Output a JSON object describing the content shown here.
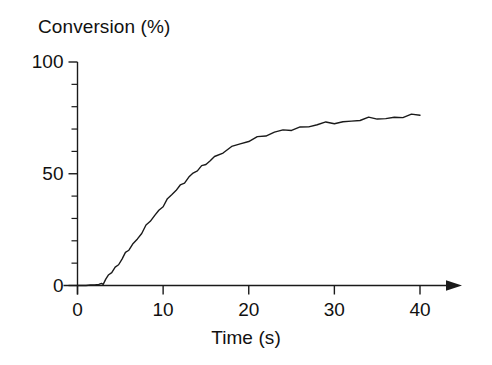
{
  "chart_data": {
    "type": "line",
    "title": "",
    "ylabel": "Conversion (%)",
    "xlabel": "Time (s)",
    "xlim": [
      0,
      45
    ],
    "ylim": [
      0,
      100
    ],
    "grid": false,
    "legend": "none",
    "x_ticks": [
      0,
      10,
      20,
      30,
      40
    ],
    "x_tick_labels": [
      "0",
      "10",
      "20",
      "30",
      "40"
    ],
    "x_minor_ticks": [],
    "y_ticks": [
      0,
      50,
      100
    ],
    "y_tick_labels": [
      "0",
      "50",
      "100"
    ],
    "y_minor_ticks": [
      10,
      20,
      30,
      40,
      60,
      70,
      80,
      90
    ],
    "axis_arrow": "x-axis-right",
    "line_color": "#1a1a1a",
    "line_width": 1.4,
    "series": [
      {
        "name": "Conversion",
        "x": [
          0.0,
          0.5,
          1.0,
          1.5,
          2.0,
          2.5,
          2.8,
          3.0,
          3.3,
          3.6,
          4.0,
          4.4,
          4.8,
          5.2,
          5.6,
          6.0,
          6.5,
          7.0,
          7.5,
          8.0,
          8.5,
          9.0,
          9.5,
          10.0,
          10.5,
          11.0,
          11.5,
          12.0,
          12.5,
          13.0,
          13.5,
          14.0,
          14.5,
          15.0,
          15.5,
          16.0,
          17.0,
          18.0,
          19.0,
          20.0,
          21.0,
          22.0,
          23.0,
          24.0,
          25.0,
          26.0,
          27.0,
          28.0,
          29.0,
          30.0,
          31.0,
          32.0,
          33.0,
          34.0,
          35.0,
          36.0,
          37.0,
          38.0,
          39.0,
          40.0
        ],
        "y": [
          0.0,
          0.0,
          0.0,
          0.2,
          0.3,
          0.5,
          0.8,
          1.4,
          2.6,
          4.0,
          6.0,
          8.0,
          10.0,
          12.0,
          14.0,
          16.0,
          18.6,
          21.2,
          23.8,
          26.3,
          28.8,
          31.2,
          33.6,
          36.0,
          38.3,
          40.5,
          42.6,
          44.6,
          46.5,
          48.3,
          50.0,
          51.6,
          53.1,
          54.6,
          56.0,
          57.3,
          59.7,
          61.7,
          63.4,
          64.9,
          66.2,
          67.3,
          68.3,
          69.2,
          70.0,
          70.7,
          71.3,
          71.9,
          72.4,
          72.9,
          73.3,
          73.7,
          74.1,
          74.4,
          74.7,
          75.0,
          75.3,
          75.6,
          75.8,
          76.0
        ]
      }
    ],
    "annotations": []
  },
  "axes": {
    "y_title": "Conversion (%)",
    "x_title": "Time (s)"
  }
}
